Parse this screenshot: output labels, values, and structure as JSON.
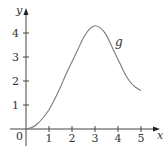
{
  "chart_data": {
    "type": "line",
    "title": "",
    "xlabel": "x",
    "ylabel": "y",
    "origin_label": "0",
    "xlim": [
      0,
      5.5
    ],
    "ylim": [
      0,
      4.6
    ],
    "grid": false,
    "legend": "none",
    "x_ticks": [
      "1",
      "2",
      "3",
      "4",
      "5"
    ],
    "y_ticks": [
      "1",
      "2",
      "3",
      "4"
    ],
    "series": [
      {
        "name": "g",
        "x": [
          0,
          0.25,
          0.5,
          0.75,
          1,
          1.25,
          1.5,
          1.75,
          2,
          2.25,
          2.5,
          2.75,
          3,
          3.25,
          3.5,
          3.75,
          4,
          4.25,
          4.5,
          4.75,
          5
        ],
        "values": [
          0,
          0.06,
          0.22,
          0.48,
          0.8,
          1.25,
          1.75,
          2.3,
          2.8,
          3.3,
          3.8,
          4.15,
          4.3,
          4.2,
          3.9,
          3.4,
          2.9,
          2.4,
          2.0,
          1.75,
          1.6
        ]
      }
    ],
    "annotations": [
      {
        "text": "g",
        "x": 3.9,
        "y": 3.6
      }
    ],
    "colors": {
      "axis": "#444444",
      "curve": "#7a7a7a",
      "text": "#333333"
    }
  }
}
